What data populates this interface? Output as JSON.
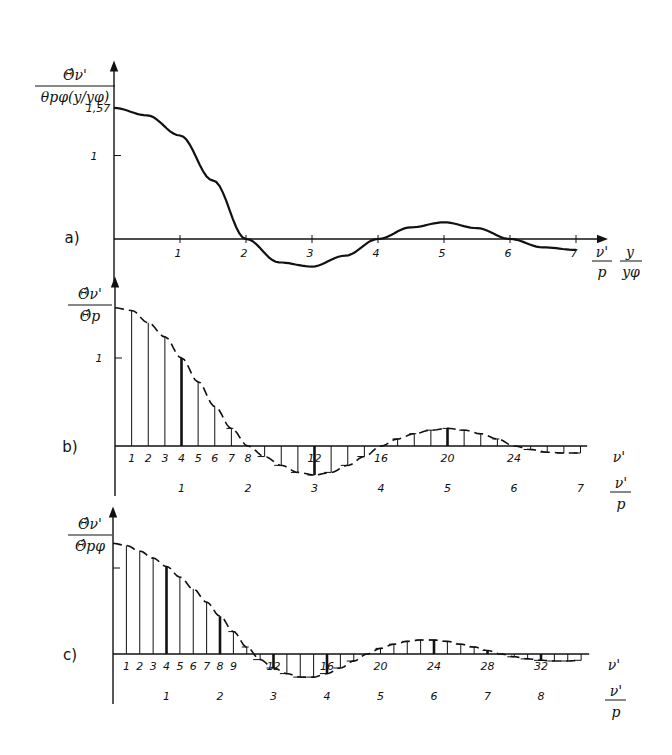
{
  "chart_data": [
    {
      "panel": "a)",
      "type": "line",
      "ylabel_num": "Θ̂ν'",
      "ylabel_den": "θpφ(y/yφ)",
      "xlabel": [
        "ν'/p",
        "y/yφ"
      ],
      "yticks": [
        "1,57",
        "1"
      ],
      "xticks": [
        "1",
        "2",
        "3",
        "4",
        "5",
        "6",
        "7"
      ],
      "x": [
        0,
        0.5,
        1,
        1.5,
        2,
        2.5,
        3,
        3.5,
        4,
        4.5,
        5,
        5.5,
        6,
        6.5,
        7
      ],
      "y": [
        1.57,
        1.48,
        1.24,
        0.7,
        0.0,
        -0.28,
        -0.33,
        -0.2,
        0.0,
        0.14,
        0.2,
        0.13,
        0.0,
        -0.1,
        -0.13
      ],
      "ylim": [
        -0.4,
        1.75
      ]
    },
    {
      "panel": "b)",
      "type": "bar",
      "style": "stems under dashed envelope",
      "ylabel_num": "Θ̂ν'",
      "ylabel_den": "Θ̂p",
      "xlabel_index": "ν'",
      "xlabel": "ν'/p",
      "yticks": [
        "1"
      ],
      "index_ticks": [
        "1",
        "2",
        "3",
        "4",
        "5",
        "6",
        "7",
        "8",
        "12",
        "16",
        "20",
        "24"
      ],
      "xticks": [
        "1",
        "2",
        "3",
        "4",
        "5",
        "6",
        "7"
      ],
      "p": 4,
      "stems_nu": [
        1,
        2,
        3,
        4,
        5,
        6,
        7,
        8,
        9,
        10,
        11,
        12,
        13,
        14,
        15,
        16,
        17,
        18,
        19,
        20,
        21,
        22,
        23,
        24,
        25,
        26,
        27,
        28
      ],
      "stems_value": [
        1.54,
        1.4,
        1.24,
        1.0,
        0.73,
        0.45,
        0.2,
        0.0,
        -0.12,
        -0.22,
        -0.3,
        -0.33,
        -0.3,
        -0.22,
        -0.12,
        0.0,
        0.08,
        0.14,
        0.18,
        0.2,
        0.18,
        0.14,
        0.08,
        0.0,
        -0.04,
        -0.07,
        -0.08,
        -0.08
      ],
      "bold_stems": [
        4,
        12,
        20
      ]
    },
    {
      "panel": "c)",
      "type": "bar",
      "style": "stems under dashed envelope",
      "ylabel_num": "Θ̂ν'",
      "ylabel_den": "Θ̂pφ",
      "xlabel_index": "ν'",
      "xlabel": "ν'/p",
      "index_ticks": [
        "1",
        "2",
        "3",
        "4",
        "5",
        "6",
        "7",
        "8",
        "9",
        "12",
        "16",
        "20",
        "24",
        "28",
        "32"
      ],
      "xticks": [
        "1",
        "2",
        "3",
        "4",
        "5",
        "6",
        "7",
        "8"
      ],
      "p": 4,
      "stems_nu": [
        1,
        2,
        3,
        4,
        5,
        6,
        7,
        8,
        9,
        10,
        11,
        12,
        13,
        14,
        15,
        16,
        17,
        18,
        19,
        20,
        21,
        22,
        23,
        24,
        25,
        26,
        27,
        28,
        29,
        30,
        31,
        32,
        33,
        34,
        35
      ],
      "stems_value": [
        1.55,
        1.47,
        1.37,
        1.25,
        1.1,
        0.93,
        0.74,
        0.54,
        0.32,
        0.1,
        -0.08,
        -0.2,
        -0.28,
        -0.33,
        -0.33,
        -0.28,
        -0.2,
        -0.1,
        0.0,
        0.08,
        0.14,
        0.18,
        0.2,
        0.2,
        0.18,
        0.14,
        0.1,
        0.05,
        0.0,
        -0.04,
        -0.07,
        -0.09,
        -0.1,
        -0.1,
        -0.09
      ],
      "bold_stems": [
        4,
        8,
        12,
        16,
        24,
        28,
        32
      ]
    }
  ]
}
